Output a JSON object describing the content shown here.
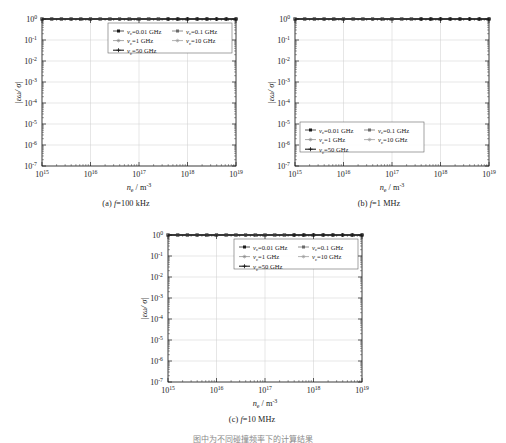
{
  "figure": {
    "bottom_note": "图中为不同碰撞频率下的计算结果",
    "axis": {
      "xlabel_main": "n",
      "xlabel_sub": "e",
      "xlabel_unit": "/ m",
      "xlabel_exp": "-3",
      "ylabel_main": "|εω/ σ|",
      "xticks": [
        "10^15",
        "10^16",
        "10^17",
        "10^18",
        "10^19"
      ],
      "xtick_exps": [
        "15",
        "16",
        "17",
        "18",
        "19"
      ],
      "ytick_exps": [
        "0",
        "-1",
        "-2",
        "-3",
        "-4",
        "-5",
        "-6",
        "-7"
      ],
      "xmin_exp": 15,
      "xmax_exp": 19,
      "ymin_exp": -7,
      "ymax_exp": 0,
      "grid": true
    },
    "legend": {
      "entries": [
        {
          "label_prefix": "ν",
          "label_sub": "c",
          "label_value": "=0.01 GHz",
          "nu_ghz": 0.01,
          "color": "#1a1a1a",
          "marker": "square"
        },
        {
          "label_prefix": "ν",
          "label_sub": "c",
          "label_value": "=0.1 GHz",
          "nu_ghz": 0.1,
          "color": "#6b6b6b",
          "marker": "square"
        },
        {
          "label_prefix": "ν",
          "label_sub": "c",
          "label_value": "=1 GHz",
          "nu_ghz": 1,
          "color": "#8a8a8a",
          "marker": "star"
        },
        {
          "label_prefix": "ν",
          "label_sub": "c",
          "label_value": "=10 GHz",
          "nu_ghz": 10,
          "color": "#9a9a9a",
          "marker": "star"
        },
        {
          "label_prefix": "ν",
          "label_sub": "c",
          "label_value": "=50 GHz",
          "nu_ghz": 50,
          "color": "#111111",
          "marker": "plus"
        }
      ]
    },
    "panels": [
      {
        "id": "a",
        "caption_label": "(a)",
        "caption_var": "f",
        "caption_value": "=100 kHz",
        "freq_hz": 100000.0,
        "legend_pos": "top-right"
      },
      {
        "id": "b",
        "caption_label": "(b)",
        "caption_var": "f",
        "caption_value": "=1 MHz",
        "freq_hz": 1000000.0,
        "legend_pos": "bottom-left"
      },
      {
        "id": "c",
        "caption_label": "(c)",
        "caption_var": "f",
        "caption_value": "=10 MHz",
        "freq_hz": 10000000.0,
        "legend_pos": "top-right"
      }
    ]
  },
  "chart_data": {
    "type": "line",
    "title": "",
    "xlabel": "n_e / m^-3",
    "ylabel": "|εω/σ|",
    "xscale": "log",
    "yscale": "log",
    "xlim": [
      1000000000000000.0,
      1e+19
    ],
    "ylim": [
      1e-07,
      1.0
    ],
    "grid": true,
    "legend_position": "varies by panel",
    "panels": [
      {
        "name": "(a) f=100 kHz",
        "freq_hz": 100000.0,
        "series": [
          {
            "name": "ν_c=0.01 GHz",
            "nu_ghz": 0.01,
            "x": [
              1000000000000000.0,
              1e+16,
              1e+17,
              1e+18,
              1e+19
            ],
            "values": [
              0.01,
              0.01,
              0.01,
              0.01,
              0.01
            ]
          },
          {
            "name": "ν_c=0.1 GHz",
            "nu_ghz": 0.1,
            "x": [
              1000000000000000.0,
              1e+16,
              1e+17,
              1e+18,
              1e+19
            ],
            "values": [
              0.001,
              0.001,
              0.001,
              0.001,
              0.001
            ]
          },
          {
            "name": "ν_c=1 GHz",
            "nu_ghz": 1,
            "x": [
              1000000000000000.0,
              1e+16,
              1e+17,
              1e+18,
              1e+19
            ],
            "values": [
              0.0001,
              0.0001,
              0.0001,
              0.0001,
              0.0001
            ]
          },
          {
            "name": "ν_c=10 GHz",
            "nu_ghz": 10,
            "x": [
              1000000000000000.0,
              3200000000000000.0,
              1e+16,
              1.3e+16,
              2e+16,
              1e+17,
              1e+18,
              1e+19
            ],
            "values": [
              0.01,
              0.0032,
              0.0002,
              1.5e-06,
              3e-05,
              9e-05,
              0.0001,
              0.0001
            ]
          },
          {
            "name": "ν_c=50 GHz",
            "nu_ghz": 50,
            "x": [
              1000000000000000.0,
              1e+16,
              1e+17,
              1e+18,
              1e+19
            ],
            "values": [
              0.06,
              0.006,
              0.0006,
              6e-05,
              4.5e-06
            ]
          }
        ]
      },
      {
        "name": "(b) f=1 MHz",
        "freq_hz": 1000000.0,
        "series": [
          {
            "name": "ν_c=0.01 GHz",
            "nu_ghz": 0.01,
            "x": [
              1000000000000000.0,
              1e+19
            ],
            "values": [
              0.08,
              0.08
            ]
          },
          {
            "name": "ν_c=0.1 GHz",
            "nu_ghz": 0.1,
            "x": [
              1000000000000000.0,
              1e+19
            ],
            "values": [
              0.009,
              0.009
            ]
          },
          {
            "name": "ν_c=1 GHz",
            "nu_ghz": 1,
            "x": [
              1000000000000000.0,
              1e+19
            ],
            "values": [
              0.001,
              0.001
            ]
          },
          {
            "name": "ν_c=10 GHz",
            "nu_ghz": 10,
            "x": [
              1000000000000000.0,
              3200000000000000.0,
              1e+16,
              1.3e+16,
              2e+16,
              1e+17,
              1e+18,
              1e+19
            ],
            "values": [
              0.009,
              0.003,
              0.0002,
              1.5e-05,
              0.0001,
              0.0008,
              0.001,
              0.001
            ]
          },
          {
            "name": "ν_c=50 GHz",
            "nu_ghz": 50,
            "x": [
              1000000000000000.0,
              1e+16,
              1e+17,
              1e+18,
              1e+19
            ],
            "values": [
              0.5,
              0.05,
              0.005,
              0.0005,
              4e-05
            ]
          }
        ]
      },
      {
        "name": "(c) f=10 MHz",
        "freq_hz": 10000000.0,
        "series": [
          {
            "name": "ν_c=0.01 GHz",
            "nu_ghz": 0.01,
            "x": [
              1000000000000000.0,
              1e+19
            ],
            "values": [
              0.01,
              0.01
            ]
          },
          {
            "name": "ν_c=0.1 GHz",
            "nu_ghz": 0.1,
            "x": [
              1000000000000000.0,
              1e+19
            ],
            "values": [
              0.01,
              0.01
            ]
          },
          {
            "name": "ν_c=1 GHz",
            "nu_ghz": 1,
            "x": [
              1000000000000000.0,
              1e+19
            ],
            "values": [
              0.001,
              0.001
            ]
          },
          {
            "name": "ν_c=10 GHz",
            "nu_ghz": 10,
            "x": [
              1000000000000000.0,
              3200000000000000.0,
              1e+16,
              1.3e+16,
              2e+16,
              1e+17,
              1e+18,
              1e+19
            ],
            "values": [
              0.0009,
              0.0003,
              2e-05,
              1.5e-06,
              1e-05,
              9e-05,
              0.0001,
              0.0001
            ]
          },
          {
            "name": "ν_c=50 GHz",
            "nu_ghz": 50,
            "x": [
              1000000000000000.0,
              1e+16,
              1e+17,
              1e+18,
              1e+19
            ],
            "values": [
              0.06,
              0.006,
              0.0006,
              6e-05,
              4.5e-06
            ]
          }
        ]
      }
    ]
  }
}
